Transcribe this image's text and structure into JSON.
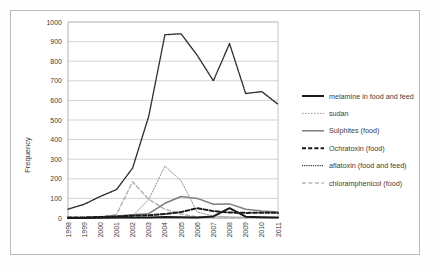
{
  "chart_data": {
    "type": "line",
    "title": "",
    "xlabel": "",
    "ylabel": "Frequency",
    "x": [
      1998,
      1999,
      2000,
      2001,
      2002,
      2003,
      2004,
      2005,
      2006,
      2007,
      2008,
      2009,
      2010,
      2011
    ],
    "categories": [
      "1998",
      "1999",
      "2000",
      "2001",
      "2002",
      "2003",
      "2004",
      "2005",
      "2006",
      "2007",
      "2008",
      "2009",
      "2010",
      "2011"
    ],
    "ylim": [
      0,
      1000
    ],
    "yticks": [
      0,
      100,
      200,
      300,
      400,
      500,
      600,
      700,
      800,
      900,
      1000
    ],
    "grid": "horizontal",
    "legend_position": "right",
    "series": [
      {
        "name": "melamine in food and feed",
        "style": "solid-thick",
        "color": "#1a1a1a",
        "values": [
          0,
          0,
          1,
          2,
          3,
          3,
          5,
          4,
          3,
          8,
          50,
          7,
          4,
          2
        ]
      },
      {
        "name": "sudan",
        "style": "dotted-light",
        "color": "#9a9a9a",
        "values": [
          0,
          0,
          0,
          2,
          10,
          95,
          265,
          190,
          30,
          10,
          6,
          4,
          3,
          2
        ]
      },
      {
        "name": "Sulphites (food)",
        "style": "solid-medium",
        "color": "#7d7d7d",
        "values": [
          2,
          3,
          6,
          10,
          17,
          22,
          75,
          110,
          100,
          70,
          72,
          45,
          36,
          30
        ]
      },
      {
        "name": "Ochratoxin (food)",
        "style": "dashed-thick",
        "color": "#1a1a1a",
        "values": [
          2,
          3,
          5,
          8,
          12,
          14,
          20,
          30,
          50,
          35,
          28,
          26,
          27,
          26
        ]
      },
      {
        "name": "aflatoxin (food and feed)",
        "style": "dotted-dark",
        "color": "#2b2b2b",
        "values": [
          45,
          70,
          110,
          145,
          255,
          520,
          935,
          940,
          830,
          700,
          890,
          635,
          645,
          580
        ]
      },
      {
        "name": "chloramphenicol (food)",
        "style": "dashed-light",
        "color": "#b5b5b5",
        "values": [
          0,
          0,
          2,
          18,
          185,
          95,
          45,
          20,
          5,
          2,
          1,
          1,
          0,
          0
        ]
      }
    ]
  },
  "axis": {
    "y_title": "Frequency",
    "y_ticks": [
      "1000",
      "900",
      "800",
      "700",
      "600",
      "500",
      "400",
      "300",
      "200",
      "100",
      "0"
    ],
    "x_ticks": [
      "1998",
      "1999",
      "2000",
      "2001",
      "2002",
      "2003",
      "2004",
      "2005",
      "2006",
      "2007",
      "2008",
      "2009",
      "2010",
      "2011"
    ]
  },
  "legend": {
    "items": [
      {
        "label": "melamine in food and feed",
        "swatch": "solid-thick"
      },
      {
        "label": "sudan",
        "swatch": "dotted-light"
      },
      {
        "label": "Sulphites (food)",
        "swatch": "solid-medium"
      },
      {
        "label": "Ochratoxin (food)",
        "swatch": "dashed-thick"
      },
      {
        "label": "aflatoxin (food and feed)",
        "swatch": "dotted-dark"
      },
      {
        "label": "chloramphenicol (food)",
        "swatch": "dashed-light"
      }
    ]
  }
}
